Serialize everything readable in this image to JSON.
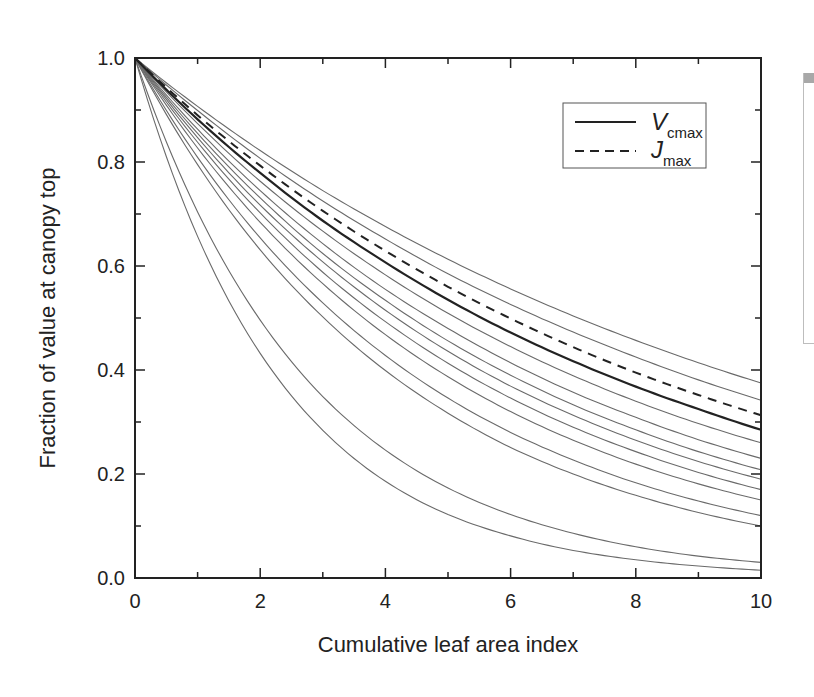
{
  "chart_data": {
    "type": "line",
    "title": "",
    "xlabel": "Cumulative leaf area index",
    "ylabel": "Fraction of value at canopy top",
    "xlim": [
      0,
      10
    ],
    "ylim": [
      0.0,
      1.0
    ],
    "x_ticks": [
      0,
      2,
      4,
      6,
      8,
      10
    ],
    "x_tick_labels": [
      "0",
      "2",
      "4",
      "6",
      "8",
      "10"
    ],
    "x_minor_ticks": [
      1,
      3,
      5,
      7,
      9
    ],
    "y_ticks": [
      0.0,
      0.2,
      0.4,
      0.6,
      0.8,
      1.0
    ],
    "y_tick_labels": [
      "0.0",
      "0.2",
      "0.4",
      "0.6",
      "0.8",
      "1.0"
    ],
    "y_minor_ticks": [
      0.1,
      0.3,
      0.5,
      0.7,
      0.9
    ],
    "grid": false,
    "legend_position": "upper right (inside)",
    "x": [
      0,
      1,
      2,
      3,
      4,
      5,
      6,
      7,
      8,
      9,
      10
    ],
    "series": [
      {
        "name": "Vcmax",
        "style": "solid-bold",
        "values": [
          1.0,
          0.882,
          0.779,
          0.687,
          0.607,
          0.535,
          0.472,
          0.417,
          0.368,
          0.325,
          0.285
        ]
      },
      {
        "name": "Jmax",
        "style": "dashed",
        "values": [
          1.0,
          0.89,
          0.793,
          0.706,
          0.629,
          0.56,
          0.499,
          0.444,
          0.395,
          0.352,
          0.313
        ]
      },
      {
        "name": "curve-1",
        "style": "thin",
        "values": [
          1.0,
          0.907,
          0.822,
          0.745,
          0.676,
          0.613,
          0.556,
          0.504,
          0.457,
          0.414,
          0.375
        ]
      },
      {
        "name": "curve-2",
        "style": "thin",
        "values": [
          1.0,
          0.899,
          0.807,
          0.725,
          0.652,
          0.585,
          0.526,
          0.473,
          0.425,
          0.381,
          0.342
        ]
      },
      {
        "name": "curve-3",
        "style": "thin",
        "values": [
          1.0,
          0.874,
          0.763,
          0.667,
          0.583,
          0.509,
          0.445,
          0.389,
          0.34,
          0.297,
          0.26
        ]
      },
      {
        "name": "curve-4",
        "style": "thin",
        "values": [
          1.0,
          0.863,
          0.745,
          0.643,
          0.555,
          0.48,
          0.414,
          0.357,
          0.309,
          0.266,
          0.23
        ]
      },
      {
        "name": "curve-5",
        "style": "thin",
        "values": [
          1.0,
          0.855,
          0.731,
          0.624,
          0.534,
          0.456,
          0.39,
          0.333,
          0.285,
          0.243,
          0.208
        ]
      },
      {
        "name": "curve-6",
        "style": "thin",
        "values": [
          1.0,
          0.847,
          0.717,
          0.608,
          0.515,
          0.436,
          0.369,
          0.313,
          0.265,
          0.224,
          0.19
        ]
      },
      {
        "name": "curve-7",
        "style": "thin",
        "values": [
          1.0,
          0.838,
          0.702,
          0.588,
          0.493,
          0.413,
          0.346,
          0.29,
          0.243,
          0.203,
          0.17
        ]
      },
      {
        "name": "curve-8",
        "style": "thin",
        "values": [
          1.0,
          0.827,
          0.684,
          0.566,
          0.468,
          0.387,
          0.32,
          0.265,
          0.219,
          0.181,
          0.15
        ]
      },
      {
        "name": "curve-9",
        "style": "thin",
        "values": [
          1.0,
          0.809,
          0.654,
          0.529,
          0.428,
          0.346,
          0.28,
          0.227,
          0.183,
          0.148,
          0.12
        ]
      },
      {
        "name": "curve-10",
        "style": "thin",
        "values": [
          1.0,
          0.795,
          0.631,
          0.502,
          0.399,
          0.317,
          0.251,
          0.2,
          0.159,
          0.126,
          0.1
        ]
      },
      {
        "name": "curve-11",
        "style": "thin",
        "values": [
          1.0,
          0.704,
          0.496,
          0.349,
          0.246,
          0.173,
          0.122,
          0.086,
          0.06,
          0.042,
          0.03
        ]
      },
      {
        "name": "curve-12",
        "style": "thin",
        "values": [
          1.0,
          0.657,
          0.432,
          0.284,
          0.186,
          0.122,
          0.081,
          0.053,
          0.035,
          0.023,
          0.015
        ]
      }
    ],
    "legend": [
      {
        "label": "V",
        "subscript": "cmax",
        "style": "solid"
      },
      {
        "label": "J",
        "subscript": "max",
        "style": "dashed"
      }
    ]
  },
  "layout": {
    "plot": {
      "left": 135,
      "top": 58,
      "right": 761,
      "bottom": 578
    },
    "colors": {
      "axis": "#222222",
      "thin_line": "#6a6a6a",
      "bold_line": "#222222",
      "legend_border": "#555555"
    }
  }
}
